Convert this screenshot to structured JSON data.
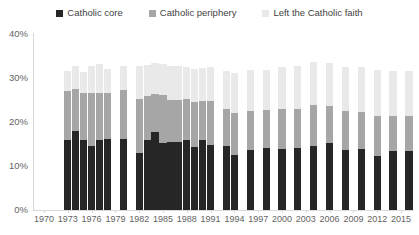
{
  "legend": {
    "items": [
      {
        "label": "Catholic core",
        "color": "#262626",
        "key": "core"
      },
      {
        "label": "Catholic periphery",
        "color": "#a6a6a6",
        "key": "periphery"
      },
      {
        "label": "Left the Catholic faith",
        "color": "#e9e9e9",
        "key": "left"
      }
    ]
  },
  "axes": {
    "y_ticks": [
      "0%",
      "10%",
      "20%",
      "30%",
      "40%"
    ],
    "x_ticks": [
      "1970",
      "1973",
      "1976",
      "1979",
      "1982",
      "1985",
      "1988",
      "1991",
      "1994",
      "1997",
      "2000",
      "2003",
      "2006",
      "2009",
      "2012",
      "2015"
    ]
  },
  "chart_data": {
    "type": "bar",
    "subtype": "stacked-column",
    "title": "",
    "xlabel": "",
    "ylabel": "",
    "ylim": [
      0,
      40
    ],
    "ytick_values": [
      0,
      10,
      20,
      30,
      40
    ],
    "ytick_labels": [
      "0%",
      "10%",
      "20%",
      "30%",
      "40%"
    ],
    "grid": false,
    "legend_position": "top-center",
    "x": [
      1973,
      1974,
      1975,
      1976,
      1977,
      1978,
      1980,
      1982,
      1983,
      1984,
      1985,
      1986,
      1987,
      1988,
      1989,
      1990,
      1991,
      1993,
      1994,
      1996,
      1998,
      2000,
      2002,
      2004,
      2006,
      2008,
      2010,
      2012,
      2014,
      2016
    ],
    "categories": [
      "1973",
      "1974",
      "1975",
      "1976",
      "1977",
      "1978",
      "1980",
      "1982",
      "1983",
      "1984",
      "1985",
      "1986",
      "1987",
      "1988",
      "1989",
      "1990",
      "1991",
      "1993",
      "1994",
      "1996",
      "1998",
      "2000",
      "2002",
      "2004",
      "2006",
      "2008",
      "2010",
      "2012",
      "2014",
      "2016"
    ],
    "series": [
      {
        "name": "Catholic core",
        "color": "#262626",
        "values": [
          15.8,
          17.9,
          15.8,
          14.6,
          16.0,
          16.1,
          16.1,
          12.9,
          15.9,
          17.8,
          15.3,
          15.5,
          15.4,
          15.9,
          14.3,
          16.0,
          14.8,
          14.5,
          12.5,
          13.6,
          14.2,
          13.8,
          14.0,
          14.6,
          15.2,
          13.6,
          13.9,
          12.3,
          13.3,
          13.4
        ]
      },
      {
        "name": "Catholic periphery",
        "color": "#a6a6a6",
        "values": [
          11.2,
          9.5,
          10.7,
          11.9,
          10.7,
          10.4,
          11.1,
          12.3,
          10.1,
          8.5,
          10.9,
          9.6,
          9.6,
          9.4,
          10.2,
          8.7,
          10.0,
          8.4,
          9.6,
          9.0,
          8.5,
          9.1,
          8.9,
          9.3,
          8.4,
          9.0,
          8.4,
          9.0,
          8.0,
          7.9
        ]
      },
      {
        "name": "Left the Catholic faith",
        "color": "#e9e9e9",
        "values": [
          4.6,
          5.4,
          4.8,
          6.2,
          6.6,
          5.5,
          5.6,
          7.6,
          7.0,
          7.2,
          7.1,
          7.6,
          7.7,
          7.3,
          7.6,
          7.5,
          7.8,
          8.8,
          9.1,
          9.3,
          9.2,
          9.5,
          9.8,
          9.8,
          9.9,
          10.0,
          10.3,
          10.6,
          10.2,
          10.4
        ]
      }
    ]
  }
}
